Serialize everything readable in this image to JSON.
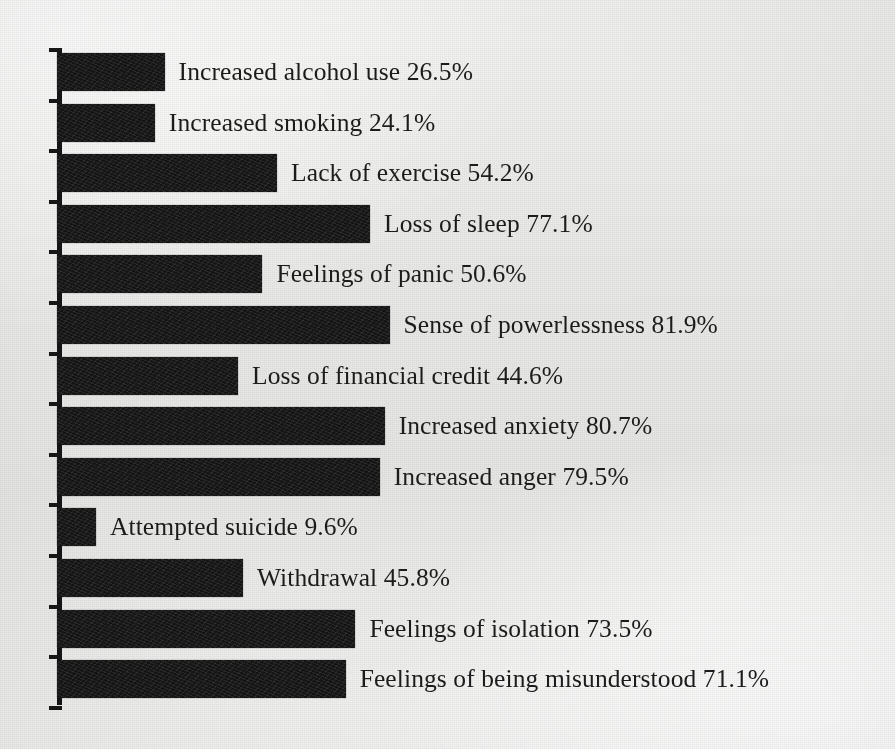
{
  "chart_data": {
    "type": "bar",
    "orientation": "horizontal",
    "title": "",
    "subtitle": "",
    "xlabel": "",
    "ylabel": "",
    "xlim": [
      0,
      100
    ],
    "grid": false,
    "legend": null,
    "bar_color": "#141414",
    "background_color": "#ededeb",
    "axis_color": "#151515",
    "value_suffix": "%",
    "label_format": "{category} {value}%",
    "categories": [
      "Increased alcohol use",
      "Increased smoking",
      "Lack of exercise",
      "Loss of sleep",
      "Feelings of panic",
      "Sense of powerlessness",
      "Loss of financial credit",
      "Increased anxiety",
      "Increased anger",
      "Attempted suicide",
      "Withdrawal",
      "Feelings of isolation",
      "Feelings of being misunderstood"
    ],
    "values": [
      26.5,
      24.1,
      54.2,
      77.1,
      50.6,
      81.9,
      44.6,
      80.7,
      79.5,
      9.6,
      45.8,
      73.5,
      71.1
    ],
    "value_labels": [
      "26.5%",
      "24.1%",
      "54.2%",
      "77.1%",
      "50.6%",
      "81.9%",
      "44.6%",
      "80.7%",
      "79.5%",
      "9.6%",
      "45.8%",
      "73.5%",
      "71.1%"
    ],
    "bar_labels": [
      "Increased alcohol use 26.5%",
      "Increased smoking 24.1%",
      "Lack of exercise 54.2%",
      "Loss of sleep 77.1%",
      "Feelings of panic 50.6%",
      "Sense of powerlessness 81.9%",
      "Loss of financial credit 44.6%",
      "Increased anxiety 80.7%",
      "Increased anger 79.5%",
      "Attempted suicide 9.6%",
      "Withdrawal 45.8%",
      "Feelings of isolation 73.5%",
      "Feelings of being misunderstood 71.1%"
    ]
  },
  "layout": {
    "axis_x": 57,
    "axis_top": 48,
    "row_pitch": 50.6,
    "bar_top_offset": 5,
    "bar_height": 38,
    "px_per_percent": 4.06,
    "label_gap": 14
  }
}
